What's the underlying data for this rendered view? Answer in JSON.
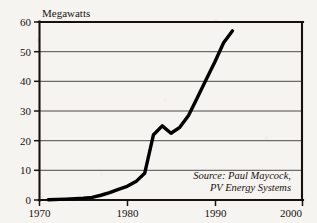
{
  "chart_data": {
    "type": "line",
    "title": "",
    "subtitle": "",
    "xlabel": "",
    "ylabel": "Megawatts",
    "xlim": [
      1970,
      2000
    ],
    "ylim": [
      0,
      60
    ],
    "xticks": [
      "1970",
      "1980",
      "1990",
      "2000"
    ],
    "xtick_values": [
      1970,
      1980,
      1990,
      2000
    ],
    "yticks": [
      "0",
      "10",
      "20",
      "30",
      "40",
      "50",
      "60"
    ],
    "ytick_values": [
      0,
      10,
      20,
      30,
      40,
      50,
      60
    ],
    "grid": "horizontal",
    "legend": "none",
    "annotations": [
      "Source: Paul Maycock,",
      "PV Energy Systems"
    ],
    "series": [
      {
        "name": "World photovoltaic shipments",
        "x": [
          1971,
          1973,
          1975,
          1976,
          1977,
          1978,
          1979,
          1980,
          1981,
          1982,
          1983,
          1984,
          1985,
          1986,
          1987,
          1988,
          1989,
          1990,
          1991,
          1992
        ],
        "values": [
          0.1,
          0.3,
          0.6,
          0.9,
          1.6,
          2.5,
          3.6,
          4.6,
          6.2,
          9.0,
          22.0,
          25.0,
          22.5,
          24.5,
          28.5,
          34.5,
          40.5,
          46.5,
          53.0,
          57.0
        ]
      }
    ]
  },
  "source_note": {
    "line1": "Source: Paul Maycock,",
    "line2": "PV Energy Systems"
  },
  "axes": {
    "y_axis_title": "Megawatts"
  }
}
